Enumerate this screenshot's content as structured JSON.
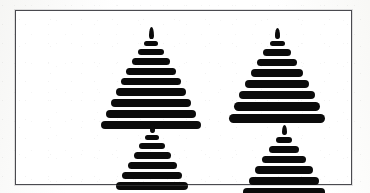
{
  "image": {
    "title": "Four stacked-bar conifer figures",
    "description": "Black-and-white line-art plate showing four stylized Christmas tree / pagoda figures built from stacked horizontal bars, each topped by a small flame-shaped finial, arranged two-by-two inside a thin rectangular frame.",
    "background_color": "#ffffff",
    "ink_color": "#0b0b0b",
    "frame_color": "#4a4a4f"
  },
  "frame": {
    "label": "plate-border",
    "x": 15,
    "y": 10,
    "width": 337,
    "height": 175,
    "border_width": 1
  },
  "figures": [
    {
      "id": "tree-top-left",
      "label": "Tree 1 (top left)",
      "position": "top-left",
      "flame": {
        "width": 5,
        "height": 12
      },
      "bar_count": 9,
      "bar_gap": 3,
      "bars": [
        {
          "width": 14,
          "height": 5
        },
        {
          "width": 26,
          "height": 6
        },
        {
          "width": 38,
          "height": 7
        },
        {
          "width": 50,
          "height": 7
        },
        {
          "width": 60,
          "height": 7
        },
        {
          "width": 70,
          "height": 8
        },
        {
          "width": 80,
          "height": 8
        },
        {
          "width": 90,
          "height": 8
        },
        {
          "width": 100,
          "height": 8
        }
      ]
    },
    {
      "id": "tree-top-right",
      "label": "Tree 2 (top right)",
      "position": "top-right",
      "flame": {
        "width": 5,
        "height": 11
      },
      "bar_count": 8,
      "bar_gap": 3,
      "bars": [
        {
          "width": 15,
          "height": 5
        },
        {
          "width": 28,
          "height": 7
        },
        {
          "width": 40,
          "height": 7
        },
        {
          "width": 52,
          "height": 8
        },
        {
          "width": 64,
          "height": 8
        },
        {
          "width": 76,
          "height": 8
        },
        {
          "width": 86,
          "height": 9
        },
        {
          "width": 96,
          "height": 9
        }
      ]
    },
    {
      "id": "tree-bottom-left",
      "label": "Tree 3 (bottom left)",
      "position": "bottom-left",
      "flame": {
        "width": 5,
        "height": 10
      },
      "bar_count": 8,
      "bar_gap": 3,
      "bars": [
        {
          "width": 14,
          "height": 5
        },
        {
          "width": 26,
          "height": 6
        },
        {
          "width": 37,
          "height": 7
        },
        {
          "width": 49,
          "height": 7
        },
        {
          "width": 60,
          "height": 7
        },
        {
          "width": 72,
          "height": 8
        },
        {
          "width": 84,
          "height": 8
        },
        {
          "width": 96,
          "height": 8
        }
      ]
    },
    {
      "id": "tree-bottom-right",
      "label": "Tree 4 (bottom right)",
      "position": "bottom-right",
      "flame": {
        "width": 5,
        "height": 10
      },
      "bar_count": 7,
      "bar_gap": 3,
      "bars": [
        {
          "width": 16,
          "height": 6
        },
        {
          "width": 30,
          "height": 7
        },
        {
          "width": 44,
          "height": 7
        },
        {
          "width": 58,
          "height": 8
        },
        {
          "width": 70,
          "height": 8
        },
        {
          "width": 82,
          "height": 8
        },
        {
          "width": 92,
          "height": 9
        }
      ]
    }
  ]
}
